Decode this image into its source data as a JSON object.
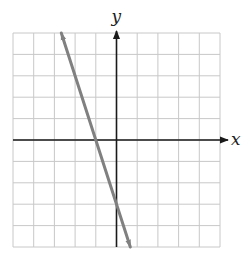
{
  "chart_data": {
    "type": "line",
    "title": "",
    "xlabel": "x",
    "ylabel": "y",
    "xlim": [
      -5,
      5
    ],
    "ylim": [
      -5,
      5
    ],
    "grid": true,
    "grid_step": 1,
    "tick_labels": false,
    "series": [
      {
        "name": "line",
        "equation": "y = -3x - 3",
        "slope": -3,
        "y_intercept": -3,
        "x_intercept": -1,
        "points": [
          [
            -2.667,
            5
          ],
          [
            -1,
            0
          ],
          [
            0,
            -3
          ],
          [
            0.667,
            -5
          ]
        ],
        "arrows_both_ends": true,
        "color": "#808080"
      }
    ]
  },
  "labels": {
    "x": "x",
    "y": "y"
  },
  "colors": {
    "grid": "#c8c8c8",
    "axis": "#1a1a1a",
    "line": "#808080"
  }
}
